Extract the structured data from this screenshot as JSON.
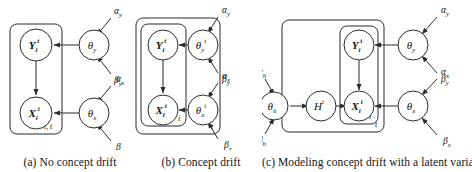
{
  "figure": {
    "type": "probabilistic-graphical-model-diagram",
    "panels": [
      {
        "id": "a",
        "caption": "(a) No concept drift",
        "plates": [
          {
            "name": "plate-it",
            "label": "i, t"
          }
        ],
        "nodes": [
          {
            "name": "Y-node",
            "base": "Y",
            "sub": "i",
            "sup": "t",
            "bold": true
          },
          {
            "name": "X-node",
            "base": "X",
            "sub": "i",
            "sup": "t",
            "bold": true
          },
          {
            "name": "theta-y",
            "base": "θ",
            "sub": "y",
            "sup": "",
            "bold": false
          },
          {
            "name": "theta-x",
            "base": "θ",
            "sub": "x",
            "sup": "",
            "bold": false
          }
        ],
        "hyperparams": [
          {
            "name": "alpha-y",
            "base": "α",
            "sub": "y"
          },
          {
            "name": "beta-y",
            "base": "β",
            "sub": "y"
          },
          {
            "name": "alpha-x",
            "base": "α",
            "sub": "x"
          },
          {
            "name": "beta-x",
            "base": "β",
            "sub": "y"
          }
        ],
        "edges": [
          "theta-y -> Y-node",
          "theta-x -> X-node",
          "Y-node -> X-node",
          "alpha-y -> theta-y",
          "beta-y -> theta-y",
          "alpha-x -> theta-x",
          "beta-x -> theta-x"
        ]
      },
      {
        "id": "b",
        "caption": "(b) Concept drift",
        "plates": [
          {
            "name": "plate-i",
            "label": "i"
          },
          {
            "name": "plate-t",
            "label": "t"
          }
        ],
        "nodes": [
          {
            "name": "Y-node",
            "base": "Y",
            "sub": "i",
            "sup": "t",
            "bold": true
          },
          {
            "name": "X-node",
            "base": "X",
            "sub": "i",
            "sup": "t",
            "bold": true
          },
          {
            "name": "theta-y",
            "base": "θ",
            "sub": "y",
            "sup": "t",
            "bold": false
          },
          {
            "name": "theta-x",
            "base": "θ",
            "sub": "x",
            "sup": "t",
            "bold": false
          }
        ],
        "hyperparams": [
          {
            "name": "alpha-y",
            "base": "α",
            "sub": "y"
          },
          {
            "name": "beta-y",
            "base": "β",
            "sub": "y"
          },
          {
            "name": "alpha-x",
            "base": "α",
            "sub": "x"
          },
          {
            "name": "beta-x",
            "base": "β",
            "sub": "x"
          }
        ],
        "edges": [
          "theta-y -> Y-node",
          "theta-x -> X-node",
          "Y-node -> X-node",
          "alpha-y -> theta-y",
          "beta-y -> theta-y",
          "alpha-x -> theta-x",
          "beta-x -> theta-x"
        ]
      },
      {
        "id": "c",
        "caption": "(c) Modeling concept drift with a latent variable",
        "plates": [
          {
            "name": "plate-i",
            "label": "i"
          },
          {
            "name": "plate-t",
            "label": "t"
          }
        ],
        "nodes": [
          {
            "name": "Y-node",
            "base": "Y",
            "sub": "i",
            "sup": "t",
            "bold": true
          },
          {
            "name": "X-node",
            "base": "X",
            "sub": "i",
            "sup": "t",
            "bold": true
          },
          {
            "name": "H-node",
            "base": "H",
            "sub": "",
            "sup": "t",
            "bold": false
          },
          {
            "name": "theta-h",
            "base": "θ",
            "sub": "h",
            "sup": "",
            "bold": false
          },
          {
            "name": "theta-y",
            "base": "θ",
            "sub": "y",
            "sup": "",
            "bold": false
          },
          {
            "name": "theta-x",
            "base": "θ",
            "sub": "x",
            "sup": "",
            "bold": false
          }
        ],
        "hyperparams": [
          {
            "name": "alpha-h",
            "base": "α",
            "sub": "h"
          },
          {
            "name": "beta-h",
            "base": "β",
            "sub": "h"
          },
          {
            "name": "alpha-y",
            "base": "α",
            "sub": "y"
          },
          {
            "name": "beta-y",
            "base": "β",
            "sub": "y"
          },
          {
            "name": "alpha-x",
            "base": "α",
            "sub": "x"
          },
          {
            "name": "beta-x",
            "base": "β",
            "sub": "x"
          }
        ],
        "edges": [
          "theta-h -> H-node",
          "H-node -> X-node",
          "theta-y -> Y-node",
          "theta-x -> X-node",
          "Y-node -> X-node",
          "alpha-h -> theta-h",
          "beta-h -> theta-h",
          "alpha-y -> theta-y",
          "beta-y -> theta-y",
          "alpha-x -> theta-x",
          "beta-x -> theta-x"
        ]
      }
    ]
  },
  "colors": {
    "stroke": "#2b2b2b",
    "text": "#141414",
    "background": "#ffffff"
  }
}
